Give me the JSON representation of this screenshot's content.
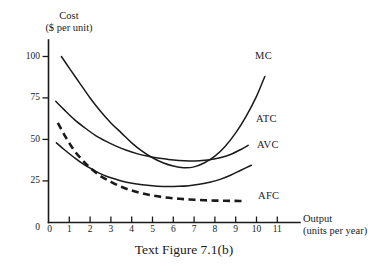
{
  "figure": {
    "caption": "Text Figure 7.1(b)"
  },
  "chart_data": {
    "type": "line",
    "title": "",
    "caption": "Text Figure 7.1(b)",
    "ylabel_line1": "Cost",
    "ylabel_line2": "($ per unit)",
    "xlabel_line1": "Output",
    "xlabel_line2": "(units per year)",
    "xlim": [
      0,
      11.8
    ],
    "ylim": [
      0,
      108
    ],
    "grid": false,
    "legend_position": "inline-right-of-curves",
    "xticks": [
      "0",
      "1",
      "2",
      "3",
      "4",
      "5",
      "6",
      "7",
      "8",
      "9",
      "10",
      "11"
    ],
    "xtick_values": [
      0,
      1,
      2,
      3,
      4,
      5,
      6,
      7,
      8,
      9,
      10,
      11
    ],
    "yticks": [
      "0",
      "25",
      "50",
      "75",
      "100"
    ],
    "ytick_values": [
      0,
      25,
      50,
      75,
      100
    ],
    "series": [
      {
        "name": "MC",
        "label": "MC",
        "style": "solid",
        "x": [
          0.62,
          1.0,
          1.5,
          2.0,
          2.5,
          3.0,
          3.5,
          4.0,
          4.5,
          5.0,
          5.5,
          6.0,
          6.5,
          7.0,
          7.5,
          8.0,
          8.5,
          9.0,
          9.5,
          10.0,
          10.4
        ],
        "y": [
          100,
          93,
          84,
          75,
          67,
          60,
          54,
          48,
          43,
          39,
          36,
          34,
          33,
          33.5,
          36,
          40,
          46,
          54,
          64,
          76,
          88
        ]
      },
      {
        "name": "ATC",
        "label": "ATC",
        "style": "solid",
        "x": [
          0.35,
          0.75,
          1.25,
          1.75,
          2.25,
          2.75,
          3.25,
          3.75,
          4.25,
          4.75,
          5.25,
          5.75,
          6.25,
          6.75,
          7.25,
          7.75,
          8.25,
          8.75,
          9.25,
          9.6
        ],
        "y": [
          73,
          68,
          62,
          57,
          52.5,
          49,
          46,
          43.5,
          41.5,
          40,
          38.8,
          38,
          37.4,
          37.1,
          37.2,
          37.8,
          39,
          41,
          44,
          46.5
        ]
      },
      {
        "name": "AVC",
        "label": "AVC",
        "style": "solid",
        "x": [
          0.38,
          0.75,
          1.25,
          1.75,
          2.25,
          2.75,
          3.25,
          3.75,
          4.25,
          4.75,
          5.25,
          5.75,
          6.25,
          6.75,
          7.25,
          7.75,
          8.25,
          8.75,
          9.25,
          9.75
        ],
        "y": [
          48,
          44,
          39,
          34.5,
          31,
          28,
          26,
          24.3,
          23.2,
          22.4,
          21.9,
          21.7,
          21.8,
          22.2,
          23,
          24.2,
          26,
          28.5,
          31.5,
          34.5
        ]
      },
      {
        "name": "AFC",
        "label": "AFC",
        "style": "dashed",
        "x": [
          0.45,
          0.8,
          1.2,
          1.6,
          2.0,
          2.5,
          3.0,
          3.5,
          4.0,
          4.5,
          5.0,
          5.5,
          6.0,
          6.5,
          7.0,
          7.5,
          8.0,
          8.5,
          9.0,
          9.5
        ],
        "y": [
          60,
          52,
          44,
          38,
          33,
          28,
          24.5,
          21.5,
          19.3,
          17.6,
          16.3,
          15.3,
          14.6,
          14.1,
          13.7,
          13.4,
          13.2,
          13.1,
          13.0,
          13.0
        ]
      }
    ],
    "annotations": [
      {
        "text": "MC",
        "x": 10.0,
        "y": 101
      },
      {
        "text": "ATC",
        "x": 10.0,
        "y": 53
      },
      {
        "text": "AVC",
        "x": 10.1,
        "y": 39
      },
      {
        "text": "AFC",
        "x": 10.1,
        "y": 16
      }
    ]
  }
}
